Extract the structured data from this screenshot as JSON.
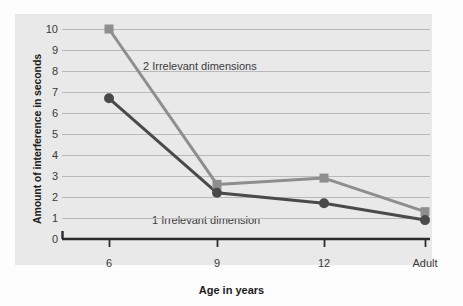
{
  "chart_data": {
    "type": "line",
    "title": "",
    "subtitle": "",
    "xlabel": "Age in years",
    "ylabel": "Amount of interference in seconds",
    "categories": [
      "6",
      "9",
      "12",
      "Adult"
    ],
    "ylim": [
      0,
      10
    ],
    "yticks": [
      "10",
      "9",
      "8",
      "7",
      "6",
      "5",
      "4",
      "3",
      "2",
      "1",
      "0"
    ],
    "grid": "horizontal",
    "legend_position": "inline-annotations",
    "series": [
      {
        "name": "2 Irrelevant dimensions",
        "values": [
          10,
          2.6,
          2.9,
          1.3
        ],
        "color": "#8e8e8e",
        "marker": "square"
      },
      {
        "name": "1 Irrelevant dimension",
        "values": [
          6.7,
          2.2,
          1.7,
          0.9
        ],
        "color": "#4a4a4a",
        "marker": "circle"
      }
    ],
    "annotations": [
      {
        "text": "2 Irrelevant dimensions"
      },
      {
        "text": "1 Irrelevant dimension"
      }
    ],
    "colors": {
      "panel_background": "#e9e9e9",
      "figure_background": "#fdfdfd",
      "gridline": "#b9b9b9",
      "axis": "#2b2b2b",
      "series_two_dimensions": "#8e8e8e",
      "series_one_dimension": "#4a4a4a",
      "tick_label": "#3a3a3a"
    }
  }
}
